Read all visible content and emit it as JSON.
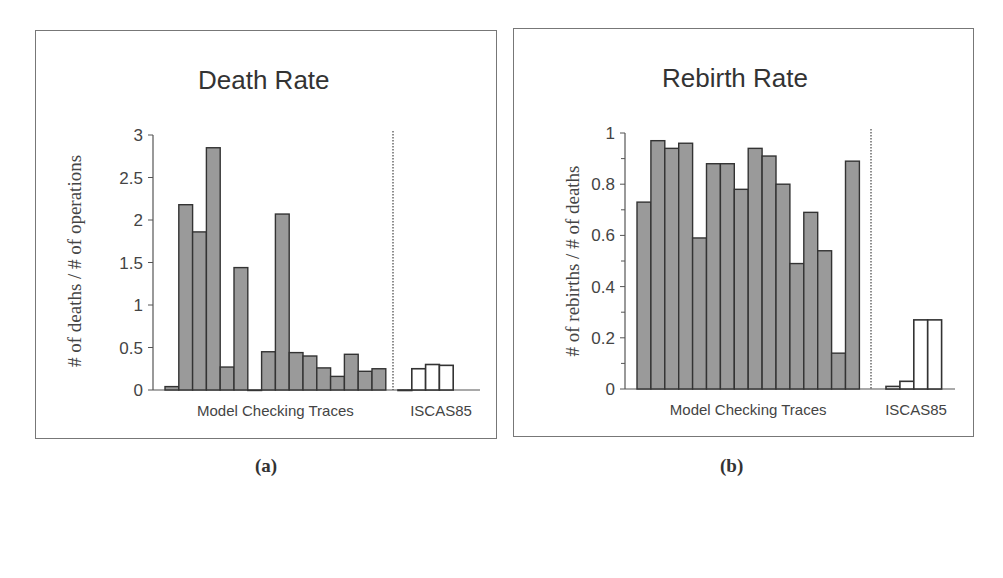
{
  "colors": {
    "filled_bar": "#9a9a9a",
    "bar_stroke": "#333333",
    "open_bar": "#ffffff",
    "axis": "#555555"
  },
  "panels": [
    {
      "caption": "(a)",
      "title": "Death Rate",
      "ylabel": "# of deaths / # of operations",
      "group_labels": [
        "Model Checking Traces",
        "ISCAS85"
      ],
      "yticks": [
        "0",
        "0.5",
        "1",
        "1.5",
        "2",
        "2.5",
        "3"
      ]
    },
    {
      "caption": "(b)",
      "title": "Rebirth Rate",
      "ylabel": "# of rebirths / # of deaths",
      "group_labels": [
        "Model Checking Traces",
        "ISCAS85"
      ],
      "yticks": [
        "0",
        "0.2",
        "0.4",
        "0.6",
        "0.8",
        "1"
      ]
    }
  ],
  "chart_data": [
    {
      "type": "bar",
      "title": "Death Rate",
      "xlabel": "",
      "ylabel": "# of deaths / # of operations",
      "ylim": [
        0,
        3
      ],
      "yticks": [
        0,
        0.5,
        1,
        1.5,
        2,
        2.5,
        3
      ],
      "grid": false,
      "groups": [
        "Model Checking Traces",
        "ISCAS85"
      ],
      "series": [
        {
          "name": "Model Checking Traces",
          "style": "filled",
          "values": [
            0.04,
            2.18,
            1.86,
            2.85,
            0.27,
            1.44,
            0.0,
            0.45,
            2.07,
            0.44,
            0.4,
            0.26,
            0.16,
            0.42,
            0.22,
            0.25
          ]
        },
        {
          "name": "ISCAS85",
          "style": "open",
          "values": [
            0.0,
            0.25,
            0.3,
            0.29
          ]
        }
      ],
      "annotations": [
        "(a)"
      ]
    },
    {
      "type": "bar",
      "title": "Rebirth Rate",
      "xlabel": "",
      "ylabel": "# of rebirths / # of deaths",
      "ylim": [
        0,
        1
      ],
      "yticks": [
        0,
        0.2,
        0.4,
        0.6,
        0.8,
        1
      ],
      "grid": false,
      "groups": [
        "Model Checking Traces",
        "ISCAS85"
      ],
      "series": [
        {
          "name": "Model Checking Traces",
          "style": "filled",
          "values": [
            0.73,
            0.97,
            0.94,
            0.96,
            0.59,
            0.88,
            0.88,
            0.78,
            0.94,
            0.91,
            0.8,
            0.49,
            0.69,
            0.54,
            0.14,
            0.89
          ]
        },
        {
          "name": "ISCAS85",
          "style": "open",
          "values": [
            0.01,
            0.03,
            0.27,
            0.27
          ]
        }
      ],
      "annotations": [
        "(b)"
      ]
    }
  ]
}
